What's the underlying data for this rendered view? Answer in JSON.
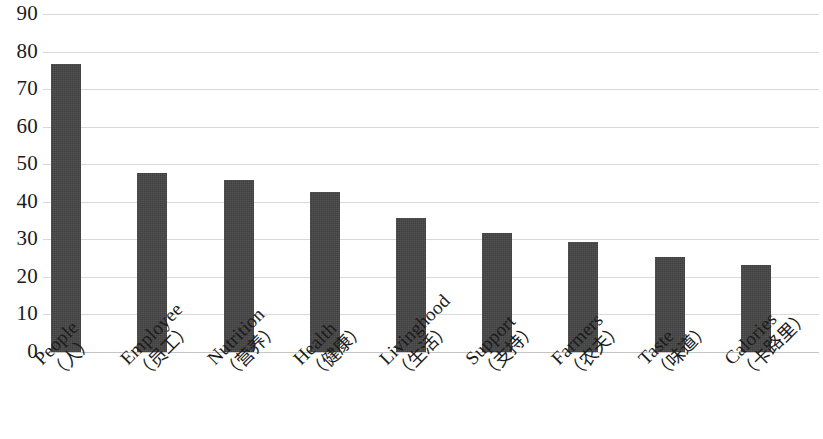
{
  "chart_data": {
    "type": "bar",
    "title": "",
    "subtitle": "",
    "xlabel": "",
    "ylabel": "",
    "ylim": [
      0,
      90
    ],
    "y_ticks": [
      0,
      10,
      20,
      30,
      40,
      50,
      60,
      70,
      80,
      90
    ],
    "y_tick_labels": [
      "0",
      "10",
      "20",
      "30",
      "40",
      "50",
      "60",
      "70",
      "80",
      "90"
    ],
    "grid": "horizontal",
    "legend": "none",
    "legend_entries": [],
    "annotations": [],
    "bar_color": "#3f3f3f",
    "orientation": "vertical",
    "categories": [
      "People（人）",
      "Employee（员工）",
      "Nutrition（营养）",
      "Health（健康）",
      "Livinghood（生活）",
      "Support（支持）",
      "Farmers（农夫）",
      "Taste（味道）",
      "Calories（卡路里）"
    ],
    "categories_split": [
      {
        "en": "People",
        "cn": "（人）"
      },
      {
        "en": "Employee",
        "cn": "（员工）"
      },
      {
        "en": "Nutrition",
        "cn": "（营养）"
      },
      {
        "en": "Health",
        "cn": "（健康）"
      },
      {
        "en": "Livinghood",
        "cn": "（生活）"
      },
      {
        "en": "Support",
        "cn": "（支持）"
      },
      {
        "en": "Farmers",
        "cn": "（农夫）"
      },
      {
        "en": "Taste",
        "cn": "（味道）"
      },
      {
        "en": "Calories",
        "cn": "（卡路里）"
      }
    ],
    "values": [
      77,
      48,
      46,
      43,
      36,
      32,
      29.5,
      25.5,
      23.5
    ]
  }
}
